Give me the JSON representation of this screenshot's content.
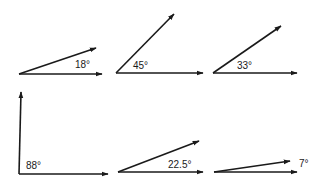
{
  "diagram": {
    "type": "angle-set",
    "colors": {
      "stroke": "#1a1a1a",
      "background": "#ffffff"
    },
    "angles": [
      {
        "label": "18°",
        "degrees": 18,
        "vertex": [
          19,
          74
        ],
        "base_end": [
          102,
          74
        ],
        "ray_end": [
          96,
          48
        ],
        "label_pos": [
          75,
          68
        ]
      },
      {
        "label": "45°",
        "degrees": 45,
        "vertex": [
          116,
          73
        ],
        "base_end": [
          203,
          73
        ],
        "ray_end": [
          174,
          14
        ],
        "label_pos": [
          133,
          69
        ]
      },
      {
        "label": "33°",
        "degrees": 33,
        "vertex": [
          213,
          73
        ],
        "base_end": [
          297,
          73
        ],
        "ray_end": [
          281,
          26
        ],
        "label_pos": [
          237,
          69
        ]
      },
      {
        "label": "88°",
        "degrees": 88,
        "vertex": [
          19,
          174
        ],
        "base_end": [
          108,
          174
        ],
        "ray_end": [
          21,
          92
        ],
        "label_pos": [
          26,
          169
        ]
      },
      {
        "label": "22.5°",
        "degrees": 22.5,
        "vertex": [
          118,
          172
        ],
        "base_end": [
          203,
          172
        ],
        "ray_end": [
          199,
          141
        ],
        "label_pos": [
          168,
          168
        ]
      },
      {
        "label": "7°",
        "degrees": 7,
        "vertex": [
          214,
          172
        ],
        "base_end": [
          297,
          172
        ],
        "ray_end": [
          290,
          161
        ],
        "label_pos": [
          299,
          167
        ]
      }
    ]
  }
}
